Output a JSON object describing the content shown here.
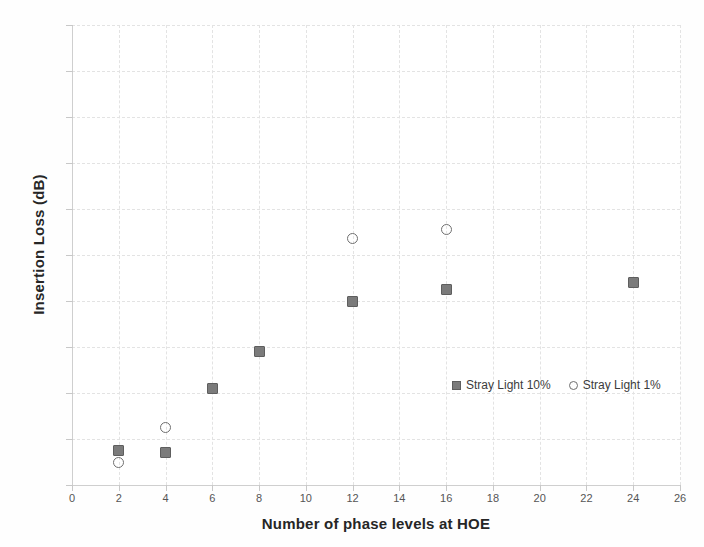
{
  "chart_data": {
    "type": "scatter",
    "title": "",
    "xlabel": "Number of phase levels at HOE",
    "ylabel": "Insertion Loss (dB)",
    "xlim": [
      0,
      26
    ],
    "ylim": [
      -2,
      0
    ],
    "xticks": [
      0,
      2,
      4,
      6,
      8,
      10,
      12,
      14,
      16,
      18,
      20,
      22,
      24,
      26
    ],
    "yticks": [
      0,
      -0.2,
      -0.4,
      -0.6,
      -0.8,
      -1,
      -1.2,
      -1.4,
      -1.6,
      -1.8,
      -2
    ],
    "xtick_labels": [
      "0",
      "2",
      "4",
      "6",
      "8",
      "10",
      "12",
      "14",
      "16",
      "18",
      "20",
      "22",
      "24",
      "26"
    ],
    "ytick_labels": [
      "0",
      "-0.2",
      "-0.4",
      "-0.6",
      "-0.8",
      "-1",
      "-1.2",
      "-1.4",
      "-1.6",
      "-1.8",
      "-2"
    ],
    "grid": true,
    "legend_position": "center-right-inside",
    "series": [
      {
        "name": "Stray Light 10%",
        "marker": "square",
        "color": "#7b7b7b",
        "x": [
          2,
          4,
          6,
          8,
          12,
          16,
          24
        ],
        "y": [
          -1.85,
          -1.86,
          -1.58,
          -1.42,
          -1.2,
          -1.15,
          -1.12
        ]
      },
      {
        "name": "Stray Light 1%",
        "marker": "circle",
        "color": "#6f6f6f",
        "x": [
          2,
          4,
          12,
          16
        ],
        "y": [
          -1.9,
          -1.75,
          -0.93,
          -0.89
        ]
      }
    ]
  },
  "legend": {
    "entries": [
      {
        "label": "Stray Light 10%",
        "marker": "square"
      },
      {
        "label": "Stray Light 1%",
        "marker": "circle"
      }
    ]
  }
}
